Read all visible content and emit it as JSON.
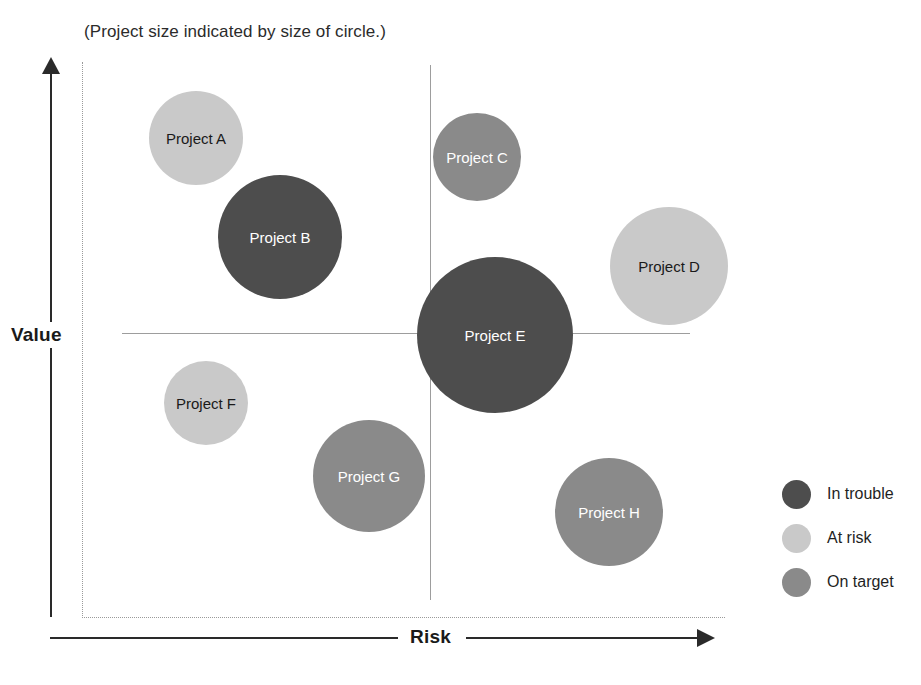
{
  "subtitle": "(Project size indicated by size of circle.)",
  "axes": {
    "y_label": "Value",
    "x_label": "Risk"
  },
  "legend": {
    "items": [
      {
        "label": "In trouble",
        "color": "#4d4d4d"
      },
      {
        "label": "At risk",
        "color": "#c9c9c9"
      },
      {
        "label": "On target",
        "color": "#8a8a8a"
      }
    ]
  },
  "chart_data": {
    "type": "scatter",
    "title": "",
    "subtitle": "(Project size indicated by size of circle.)",
    "xlabel": "Risk",
    "ylabel": "Value",
    "grid": false,
    "legend_position": "right",
    "size_meaning": "Project size indicated by size of circle.",
    "quadrant_lines": {
      "x": 0.5,
      "y": 0.5
    },
    "status_colors": {
      "In trouble": "#4d4d4d",
      "At risk": "#c9c9c9",
      "On target": "#8a8a8a"
    },
    "points": [
      {
        "label": "Project A",
        "status": "At risk",
        "x": 0.155,
        "y": 0.795,
        "size": 47,
        "color": "#c9c9c9",
        "text_color": "#1a1a1a",
        "cx": 196,
        "cy": 138
      },
      {
        "label": "Project B",
        "status": "In trouble",
        "x": 0.3,
        "y": 0.655,
        "size": 62,
        "color": "#4d4d4d",
        "text_color": "#ffffff",
        "cx": 280,
        "cy": 237
      },
      {
        "label": "Project C",
        "status": "On target",
        "x": 0.575,
        "y": 0.76,
        "size": 44,
        "color": "#8a8a8a",
        "text_color": "#ffffff",
        "cx": 477,
        "cy": 157
      },
      {
        "label": "Project D",
        "status": "At risk",
        "x": 0.845,
        "y": 0.61,
        "size": 59,
        "color": "#c9c9c9",
        "text_color": "#1a1a1a",
        "cx": 669,
        "cy": 266
      },
      {
        "label": "Project E",
        "status": "In trouble",
        "x": 0.5,
        "y": 0.5,
        "size": 78,
        "color": "#4d4d4d",
        "text_color": "#ffffff",
        "cx": 495,
        "cy": 335
      },
      {
        "label": "Project F",
        "status": "At risk",
        "x": 0.175,
        "y": 0.36,
        "size": 42,
        "color": "#c9c9c9",
        "text_color": "#1a1a1a",
        "cx": 206,
        "cy": 403
      },
      {
        "label": "Project G",
        "status": "On target",
        "x": 0.405,
        "y": 0.255,
        "size": 56,
        "color": "#8a8a8a",
        "text_color": "#ffffff",
        "cx": 369,
        "cy": 476
      },
      {
        "label": "Project H",
        "status": "On target",
        "x": 0.7,
        "y": 0.175,
        "size": 54,
        "color": "#8a8a8a",
        "text_color": "#ffffff",
        "cx": 609,
        "cy": 512
      }
    ]
  }
}
